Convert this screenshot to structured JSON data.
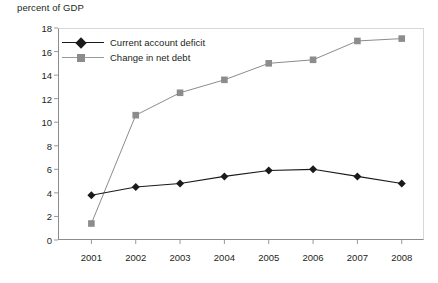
{
  "chart_data": {
    "type": "line",
    "title": "percent of GDP",
    "xlabel": "",
    "ylabel": "percent of GDP",
    "categories": [
      "2001",
      "2002",
      "2003",
      "2004",
      "2005",
      "2006",
      "2007",
      "2008"
    ],
    "x": [
      2001,
      2002,
      2003,
      2004,
      2005,
      2006,
      2007,
      2008
    ],
    "ylim": [
      0,
      18
    ],
    "yticks": [
      0,
      2,
      4,
      6,
      8,
      10,
      12,
      14,
      16,
      18
    ],
    "ytick_labels": [
      "0",
      "2",
      "4",
      "6",
      "8",
      "10",
      "12",
      "14",
      "16",
      "18"
    ],
    "grid": false,
    "legend_position": "top-left inside plot",
    "series": [
      {
        "name": "Current account deficit",
        "color": "#1a1a1a",
        "marker": "diamond",
        "values": [
          3.8,
          4.5,
          4.8,
          5.4,
          5.9,
          6.0,
          5.4,
          4.8
        ]
      },
      {
        "name": "Change in net debt",
        "color": "#8c8c8c",
        "marker": "square",
        "values": [
          1.4,
          10.6,
          12.5,
          13.6,
          15.0,
          15.3,
          16.9,
          17.1
        ]
      }
    ]
  },
  "legend": {
    "items": [
      {
        "label": "Current account deficit"
      },
      {
        "label": "Change in net debt"
      }
    ]
  },
  "colors": {
    "series_1": "#1a1a1a",
    "series_2": "#8c8c8c",
    "axis": "#8c8c8c",
    "text": "#231f20"
  }
}
